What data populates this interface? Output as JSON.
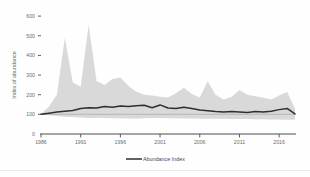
{
  "chart_data": {
    "type": "line",
    "title": "",
    "subtitle": "",
    "xlabel": "",
    "ylabel": "Index of abundance",
    "xlim": [
      1986,
      2018
    ],
    "ylim": [
      0,
      640
    ],
    "ytick_labels": [
      "600",
      "500",
      "400",
      "300",
      "200",
      "100",
      "0"
    ],
    "ytick_values": [
      600,
      500,
      400,
      300,
      200,
      100,
      0
    ],
    "xtick_labels": [
      "1986",
      "1991",
      "1996",
      "2001",
      "2006",
      "2011",
      "2016"
    ],
    "xtick_values": [
      1986,
      1991,
      1996,
      2001,
      2006,
      2011,
      2016
    ],
    "grid": false,
    "legend_position": "bottom-center",
    "legend": [
      {
        "name": "Abundance Index",
        "color": "#2e2e2e",
        "marker": "line"
      }
    ],
    "reference_line": {
      "value": 100,
      "color": "#bdbdbd"
    },
    "band": {
      "name": "Confidence interval",
      "color": "#d2d2d2",
      "lower": [
        100,
        96,
        92,
        88,
        86,
        84,
        82,
        83,
        82,
        80,
        80,
        79,
        78,
        80,
        82,
        81,
        80,
        80,
        79,
        79,
        78,
        78,
        77,
        77,
        76,
        76,
        76,
        75,
        75,
        74,
        74,
        73,
        72
      ],
      "upper": [
        100,
        140,
        200,
        490,
        262,
        240,
        555,
        270,
        250,
        280,
        288,
        246,
        215,
        200,
        196,
        190,
        186,
        208,
        236,
        204,
        186,
        268,
        200,
        176,
        188,
        224,
        200,
        192,
        184,
        176,
        196,
        214,
        130
      ]
    },
    "x": [
      1986,
      1987,
      1988,
      1989,
      1990,
      1991,
      1992,
      1993,
      1994,
      1995,
      1996,
      1997,
      1998,
      1999,
      2000,
      2001,
      2002,
      2003,
      2004,
      2005,
      2006,
      2007,
      2008,
      2009,
      2010,
      2011,
      2012,
      2013,
      2014,
      2015,
      2016,
      2017,
      2018
    ],
    "series": [
      {
        "name": "Abundance Index",
        "color": "#2e2e2e",
        "values": [
          100,
          106,
          112,
          116,
          120,
          130,
          134,
          132,
          140,
          136,
          142,
          140,
          144,
          146,
          134,
          148,
          132,
          130,
          136,
          130,
          122,
          118,
          114,
          112,
          114,
          112,
          110,
          114,
          112,
          116,
          124,
          130,
          102
        ]
      }
    ]
  }
}
